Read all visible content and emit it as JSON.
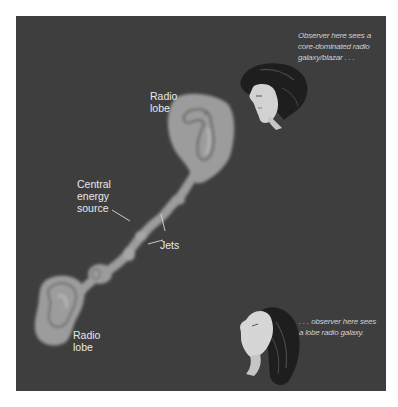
{
  "diagram": {
    "colors": {
      "background": "#3e3e3e",
      "lobe_fill": "#9c9c9c",
      "lobe_contour": "#6e6e6e",
      "lobe_core": "#b5b5b5",
      "label_text": "#e8e8e8",
      "caption_text": "#cfcfcf",
      "leader_line": "#d8d8d8"
    },
    "labels": {
      "upper_lobe": [
        "Radio",
        "lobe"
      ],
      "lower_lobe": [
        "Radio",
        "lobe"
      ],
      "central_source": [
        "Central",
        "energy",
        "source"
      ],
      "jets": "Jets"
    },
    "observers": {
      "top": {
        "caption": [
          "Observer here sees a",
          "core-dominated radio",
          "galaxy/blazar . . ."
        ],
        "icon": "observer-face-looking-down-left"
      },
      "bottom": {
        "caption": [
          ". . . observer here sees",
          "a lobe radio galaxy."
        ],
        "icon": "observer-face-looking-up-left"
      }
    }
  }
}
